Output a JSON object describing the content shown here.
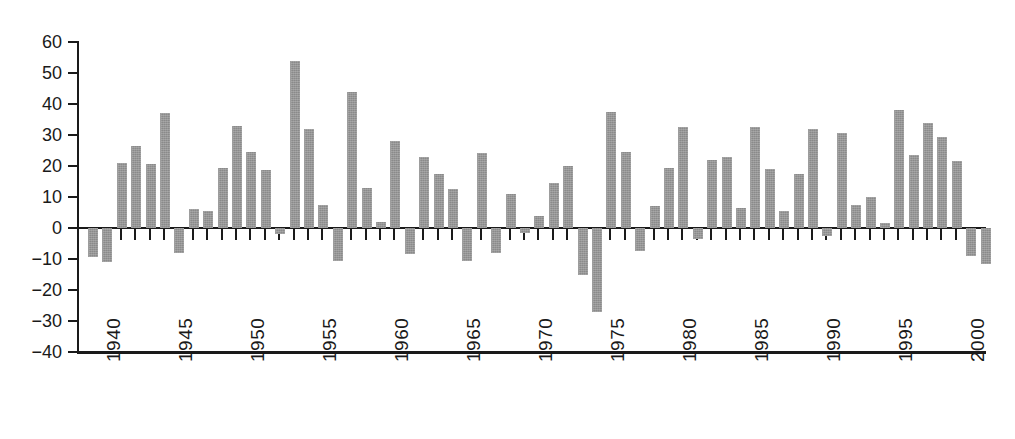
{
  "chart_data": {
    "type": "bar",
    "title": "",
    "subtitle": "",
    "xlabel": "",
    "ylabel": "",
    "grid": false,
    "legend": null,
    "orientation": "vertical",
    "bar_color": "#8a8a8a",
    "axis_color": "#1a1a1a",
    "background": "#ffffff",
    "ylim": [
      -40,
      60
    ],
    "yticks": [
      60,
      50,
      40,
      30,
      20,
      10,
      0,
      -10,
      -20,
      -30,
      -40
    ],
    "ytick_labels": [
      "60",
      "50",
      "40",
      "30",
      "20",
      "10",
      "0",
      "−10",
      "−20",
      "−30",
      "−40"
    ],
    "xlim": [
      1939.3,
      2002.3
    ],
    "xticks": [
      1940,
      1945,
      1950,
      1955,
      1960,
      1965,
      1970,
      1975,
      1980,
      1985,
      1990,
      1995,
      2000
    ],
    "xtick_labels": [
      "1940",
      "1945",
      "1950",
      "1955",
      "1960",
      "1965",
      "1970",
      "1975",
      "1980",
      "1985",
      "1990",
      "1995",
      "2000"
    ],
    "xtick_rotation": 90,
    "categories": [
      1940,
      1941,
      1942,
      1943,
      1944,
      1945,
      1946,
      1947,
      1948,
      1949,
      1950,
      1951,
      1952,
      1953,
      1954,
      1955,
      1956,
      1957,
      1958,
      1959,
      1960,
      1961,
      1962,
      1963,
      1964,
      1965,
      1966,
      1967,
      1968,
      1969,
      1970,
      1971,
      1972,
      1973,
      1974,
      1975,
      1976,
      1977,
      1978,
      1979,
      1980,
      1981,
      1982,
      1983,
      1984,
      1985,
      1986,
      1987,
      1988,
      1989,
      1990,
      1991,
      1992,
      1993,
      1994,
      1995,
      1996,
      1997,
      1998,
      1999,
      2000,
      2001,
      2002
    ],
    "values": [
      -9.5,
      -11,
      21,
      26.5,
      20.8,
      37,
      -8,
      6,
      5.5,
      19.5,
      32.8,
      24.5,
      18.8,
      -2,
      54,
      32,
      7.5,
      -10.5,
      44,
      13,
      1.8,
      28,
      -8.5,
      23,
      17.5,
      12.5,
      -10.5,
      24.3,
      -8,
      11,
      -1.5,
      4,
      14.5,
      20,
      -15,
      -27,
      37.5,
      24.5,
      -7.5,
      7,
      19.5,
      32.5,
      -3.5,
      21.8,
      22.8,
      6.5,
      32.5,
      19,
      5.5,
      17.5,
      32,
      -2.5,
      30.8,
      7.5,
      10,
      1.5,
      38,
      23.5,
      34,
      29.5,
      21.5,
      -9,
      -11.5
    ]
  }
}
